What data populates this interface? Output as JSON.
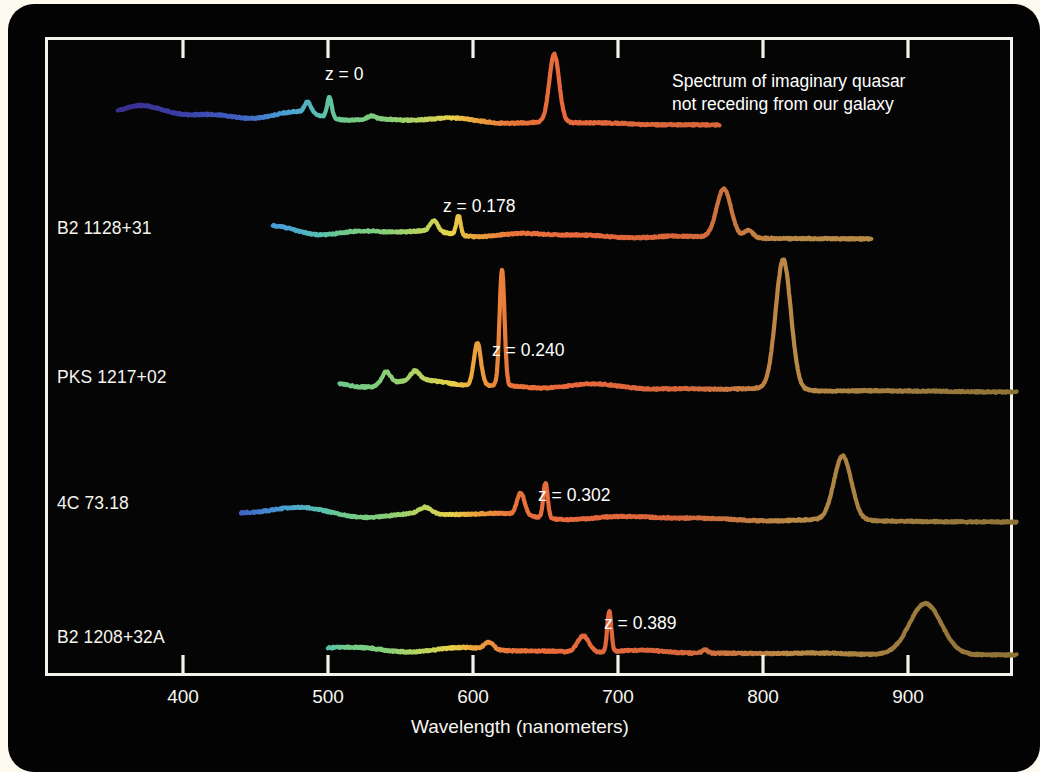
{
  "figure": {
    "background": "#fdfaf0",
    "panel_color": "#030303",
    "frame_color": "#f4f2ea",
    "axis_title": "Wavelength (nanometers)",
    "annotation": "Spectrum of imaginary quasar not receding from our galaxy"
  },
  "chart_data": {
    "type": "line",
    "title": "",
    "subtitle": "",
    "xlabel": "Wavelength (nanometers)",
    "ylabel": "",
    "xlim": [
      330,
      975
    ],
    "xticks": [
      400,
      500,
      600,
      700,
      800,
      900
    ],
    "xticklabels": [
      "400",
      "500",
      "600",
      "700",
      "800",
      "900"
    ],
    "grid": false,
    "legend": "none",
    "annotations": [
      {
        "text": "Spectrum of imaginary quasar not receding from our galaxy",
        "x": 665,
        "y": 70
      }
    ],
    "series": [
      {
        "name": "",
        "object_label": "",
        "redshift_label": "z = 0",
        "redshift": 0,
        "row": 0,
        "start_nm": 355,
        "end_nm": 770,
        "halpha_peak_nm": 656,
        "peak_relative_height": 1.0,
        "emission_lines_nm": [
          486,
          501,
          656
        ],
        "color_start": "#3b3fa8",
        "color_end": "#e8693c"
      },
      {
        "name": "",
        "object_label": "B2 1128+31",
        "redshift_label": "z = 0.178",
        "redshift": 0.178,
        "row": 1,
        "start_nm": 462,
        "end_nm": 875,
        "halpha_peak_nm": 773,
        "peak_relative_height": 0.78,
        "emission_lines_nm": [
          573,
          590,
          773
        ],
        "color_start": "#7fc79a",
        "color_end": "#b08a4a"
      },
      {
        "name": "",
        "object_label": "PKS 1217+02",
        "redshift_label": "z = 0.240",
        "redshift": 0.24,
        "row": 2,
        "start_nm": 508,
        "end_nm": 975,
        "halpha_peak_nm": 814,
        "peak_relative_height": 1.0,
        "emission_lines_nm": [
          603,
          620,
          814
        ],
        "color_start": "#7fc79a",
        "color_end": "#9d7b3e"
      },
      {
        "name": "",
        "object_label": "4C 73.18",
        "redshift_label": "z = 0.302",
        "redshift": 0.302,
        "row": 3,
        "start_nm": 440,
        "end_nm": 975,
        "halpha_peak_nm": 855,
        "peak_relative_height": 0.62,
        "emission_lines_nm": [
          633,
          650,
          855
        ],
        "color_start": "#8ecf9e",
        "color_end": "#9d7b3e"
      },
      {
        "name": "",
        "object_label": "B2 1208+32A",
        "redshift_label": "z = 0.389",
        "redshift": 0.389,
        "row": 4,
        "start_nm": 500,
        "end_nm": 975,
        "halpha_peak_nm": 912,
        "peak_relative_height": 0.46,
        "emission_lines_nm": [
          676,
          694,
          912
        ],
        "color_start": "#86c98f",
        "color_end": "#8d7236"
      }
    ]
  },
  "row_labels": {
    "r0": "",
    "r1": "B2 1128+31",
    "r2": "PKS 1217+02",
    "r3": "4C 73.18",
    "r4": "B2 1208+32A"
  },
  "z_labels": {
    "r0": "z = 0",
    "r1": "z = 0.178",
    "r2": "z = 0.240",
    "r3": "z = 0.302",
    "r4": "z = 0.389"
  },
  "ticks": {
    "t0": "400",
    "t1": "500",
    "t2": "600",
    "t3": "700",
    "t4": "800",
    "t5": "900"
  }
}
